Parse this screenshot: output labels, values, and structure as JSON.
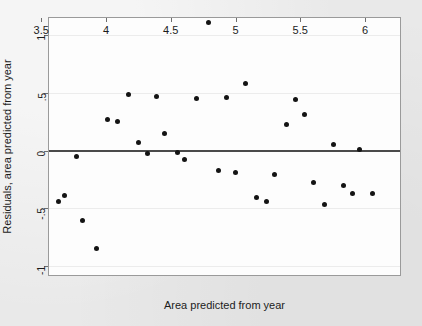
{
  "chart_data": {
    "type": "scatter",
    "title": "",
    "xlabel": "Area predicted from year",
    "ylabel": "Residuals, area predicted from year",
    "xlim": [
      3.56,
      6.27
    ],
    "ylim": [
      -1.08,
      1.15
    ],
    "xticks": [
      3.5,
      4,
      4.5,
      5,
      5.5,
      6
    ],
    "xtick_labels": [
      "3.5",
      "4",
      "4.5",
      "5",
      "5.5",
      "6"
    ],
    "yticks": [
      1,
      0.5,
      0,
      -0.5,
      -1
    ],
    "ytick_labels": [
      "1",
      ".5",
      "0",
      "-.5",
      "-1"
    ],
    "grid": true,
    "gridlines_y": [
      1,
      0.5,
      -0.5,
      -1
    ],
    "reference_line_y": 0,
    "marker": "filled-circle",
    "marker_color": "#141414",
    "background_color": "#e9e9e9",
    "plot_background_color": "#fdfdfd",
    "n_points": 36,
    "points": [
      {
        "x": 3.63,
        "y": -0.44
      },
      {
        "x": 3.68,
        "y": -0.39
      },
      {
        "x": 3.77,
        "y": -0.05
      },
      {
        "x": 3.82,
        "y": -0.61
      },
      {
        "x": 3.93,
        "y": -0.85
      },
      {
        "x": 4.01,
        "y": 0.27
      },
      {
        "x": 4.09,
        "y": 0.25
      },
      {
        "x": 4.17,
        "y": 0.49
      },
      {
        "x": 4.25,
        "y": 0.07
      },
      {
        "x": 4.32,
        "y": -0.03
      },
      {
        "x": 4.39,
        "y": 0.47
      },
      {
        "x": 4.45,
        "y": 0.15
      },
      {
        "x": 4.55,
        "y": -0.02
      },
      {
        "x": 4.61,
        "y": -0.08
      },
      {
        "x": 4.7,
        "y": 0.45
      },
      {
        "x": 4.79,
        "y": 1.11
      },
      {
        "x": 4.87,
        "y": -0.17
      },
      {
        "x": 4.93,
        "y": 0.46
      },
      {
        "x": 5.0,
        "y": -0.19
      },
      {
        "x": 5.08,
        "y": 0.58
      },
      {
        "x": 5.16,
        "y": -0.41
      },
      {
        "x": 5.24,
        "y": -0.44
      },
      {
        "x": 5.3,
        "y": -0.21
      },
      {
        "x": 5.39,
        "y": 0.23
      },
      {
        "x": 5.46,
        "y": 0.44
      },
      {
        "x": 5.53,
        "y": 0.31
      },
      {
        "x": 5.6,
        "y": -0.28
      },
      {
        "x": 5.69,
        "y": -0.47
      },
      {
        "x": 5.76,
        "y": 0.05
      },
      {
        "x": 5.83,
        "y": -0.3
      },
      {
        "x": 5.9,
        "y": -0.37
      },
      {
        "x": 5.96,
        "y": 0.01
      },
      {
        "x": 6.06,
        "y": -0.37
      }
    ]
  }
}
